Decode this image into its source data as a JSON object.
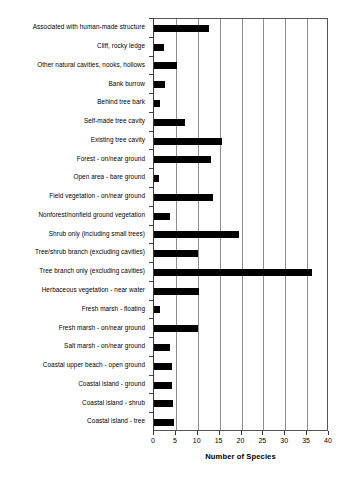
{
  "chart_data": {
    "type": "bar",
    "orientation": "horizontal",
    "title": "",
    "xlabel": "Number of Species",
    "ylabel": "",
    "xlim": [
      0,
      40
    ],
    "xticks": [
      0,
      5,
      10,
      15,
      20,
      25,
      30,
      35,
      40
    ],
    "xtick_labels": [
      "0",
      "5",
      "10",
      "15",
      "20",
      "25",
      "30",
      "35",
      "40"
    ],
    "grid": "vertical",
    "legend": "none",
    "bar_color": "#000000",
    "categories": [
      "Associated with human-made structure",
      "Cliff, rocky ledge",
      "Other natural cavities, nooks, hollows",
      "Bank burrow",
      "Behind tree bark",
      "Self-made tree cavity",
      "Existing tree cavity",
      "Forest - on/near ground",
      "Open area - bare ground",
      "Field vegetation - on/near ground",
      "Nonforest/nonfield ground vegetation",
      "Shrub only (including small trees)",
      "Tree/shrub branch (excluding cavities)",
      "Tree branch only (excluding cavities)",
      "Herbaceous vegetation - near water",
      "Fresh marsh - floating",
      "Fresh marsh - on/near ground",
      "Salt marsh - on/near ground",
      "Coastal upper beach - open ground",
      "Coastal island - ground",
      "Coastal island - shrub",
      "Coastal island - tree"
    ],
    "values": [
      12.5,
      2.3,
      5.2,
      2.4,
      1.4,
      7,
      15.5,
      13,
      1.2,
      13.5,
      3.6,
      19.5,
      10,
      36,
      10.2,
      1.4,
      10,
      3.6,
      4,
      4.2,
      4.3,
      4.6
    ]
  }
}
